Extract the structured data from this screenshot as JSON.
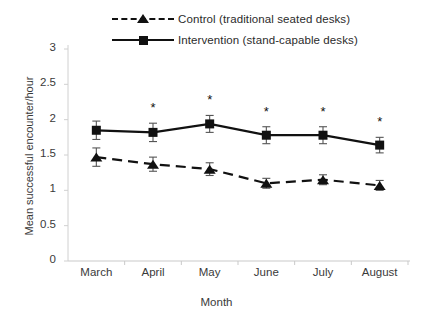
{
  "chart_data": {
    "type": "line",
    "title": "",
    "xlabel": "Month",
    "ylabel": "Mean successful encounter/hour",
    "categories": [
      "March",
      "April",
      "May",
      "June",
      "July",
      "August"
    ],
    "ylim": [
      0,
      3
    ],
    "yticks": [
      "0",
      "0.5",
      "1",
      "1.5",
      "2",
      "2.5",
      "3"
    ],
    "ytick_values": [
      0,
      0.5,
      1,
      1.5,
      2,
      2.5,
      3
    ],
    "grid": false,
    "legend_position": "top",
    "series": [
      {
        "name": "Control (traditional seated desks)",
        "marker": "triangle",
        "line_style": "dashed",
        "color": "#111111",
        "values": [
          1.47,
          1.37,
          1.3,
          1.1,
          1.15,
          1.07
        ],
        "error": [
          0.13,
          0.1,
          0.09,
          0.07,
          0.07,
          0.07
        ]
      },
      {
        "name": "Intervention (stand-capable desks)",
        "marker": "square",
        "line_style": "solid",
        "color": "#111111",
        "values": [
          1.85,
          1.82,
          1.94,
          1.78,
          1.78,
          1.64
        ],
        "error": [
          0.13,
          0.13,
          0.12,
          0.12,
          0.12,
          0.11
        ]
      }
    ],
    "annotations": [
      {
        "category": "April",
        "text": "*"
      },
      {
        "category": "May",
        "text": "*"
      },
      {
        "category": "June",
        "text": "*"
      },
      {
        "category": "July",
        "text": "*"
      },
      {
        "category": "August",
        "text": "*"
      }
    ]
  },
  "legend": {
    "items": [
      {
        "label": "Control (traditional seated desks)"
      },
      {
        "label": "Intervention (stand-capable desks)"
      }
    ]
  }
}
